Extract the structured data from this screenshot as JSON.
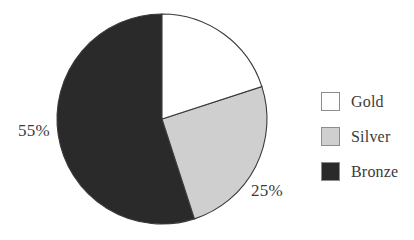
{
  "chart_data": {
    "type": "pie",
    "title": "",
    "categories": [
      "Gold",
      "Silver",
      "Bronze"
    ],
    "values": [
      20,
      25,
      55
    ],
    "value_unit": "%",
    "labels": [
      {
        "category": "Gold",
        "text": "",
        "shown": false
      },
      {
        "category": "Silver",
        "text": "25%",
        "shown": true
      },
      {
        "category": "Bronze",
        "text": "55%",
        "shown": true
      }
    ],
    "colors": [
      "#ffffff",
      "#cfcfcf",
      "#2a2a2a"
    ],
    "outline_color": "#3a3a3a",
    "start_angle_deg": 0,
    "direction": "clockwise",
    "legend_position": "right",
    "grid": false,
    "background": "#ffffff"
  },
  "legend": {
    "items": [
      {
        "label": "Gold",
        "color": "#ffffff"
      },
      {
        "label": "Silver",
        "color": "#cfcfcf"
      },
      {
        "label": "Bronze",
        "color": "#2a2a2a"
      }
    ]
  },
  "labels": {
    "bronze_pct": "55%",
    "silver_pct": "25%",
    "gold_pct": ""
  }
}
